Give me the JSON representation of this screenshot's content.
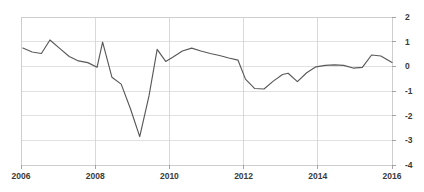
{
  "chart_data": {
    "type": "line",
    "title": "",
    "subtitle": "",
    "xlabel": "",
    "ylabel": "",
    "xlim": [
      2006,
      2016
    ],
    "ylim": [
      -4,
      2
    ],
    "grid": true,
    "legend": null,
    "legend_position": "none",
    "line_color": "#595959",
    "grid_color": "#d9d9d9",
    "background_color": "#ffffff",
    "y_ticks": [
      2,
      1,
      0,
      -1,
      -2,
      -3,
      -4
    ],
    "y_tick_labels": [
      "2",
      "1",
      "0",
      "-1",
      "-2",
      "-3",
      "-4"
    ],
    "x_ticks": [
      2006,
      2008,
      2010,
      2012,
      2014,
      2016
    ],
    "x_tick_labels": [
      "2006",
      "2008",
      "2010",
      "2012",
      "2014",
      "2016"
    ],
    "series": [
      {
        "name": "series-1",
        "x": [
          2006.05,
          2006.3,
          2006.55,
          2006.78,
          2007.05,
          2007.3,
          2007.55,
          2007.8,
          2008.05,
          2008.2,
          2008.45,
          2008.7,
          2008.95,
          2009.2,
          2009.45,
          2009.67,
          2009.9,
          2010.1,
          2010.35,
          2010.6,
          2010.85,
          2011.1,
          2011.35,
          2011.6,
          2011.85,
          2012.05,
          2012.3,
          2012.55,
          2012.8,
          2013.05,
          2013.2,
          2013.45,
          2013.7,
          2013.95,
          2014.2,
          2014.45,
          2014.7,
          2014.95,
          2015.2,
          2015.45,
          2015.7,
          2016.0
        ],
        "values": [
          0.74,
          0.58,
          0.52,
          1.07,
          0.72,
          0.4,
          0.22,
          0.15,
          -0.04,
          0.98,
          -0.44,
          -0.72,
          -1.72,
          -2.85,
          -1.2,
          0.69,
          0.2,
          0.38,
          0.62,
          0.74,
          0.62,
          0.52,
          0.44,
          0.34,
          0.25,
          -0.52,
          -0.9,
          -0.92,
          -0.6,
          -0.33,
          -0.28,
          -0.62,
          -0.26,
          -0.02,
          0.04,
          0.06,
          0.04,
          -0.07,
          -0.04,
          0.46,
          0.42,
          0.16
        ]
      }
    ]
  }
}
